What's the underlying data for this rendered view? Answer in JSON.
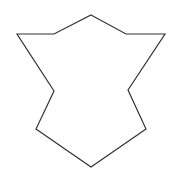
{
  "figure": {
    "width": 175,
    "height": 184,
    "background": "#ffffff",
    "shape": {
      "type": "polygon",
      "stroke": "#333333",
      "stroke_width": 1.2,
      "fill": "none",
      "points": [
        [
          91,
          15
        ],
        [
          126,
          34
        ],
        [
          165,
          34
        ],
        [
          128,
          90
        ],
        [
          146,
          129
        ],
        [
          91,
          167
        ],
        [
          36,
          129
        ],
        [
          54,
          91
        ],
        [
          17,
          34
        ],
        [
          54,
          34
        ]
      ]
    }
  }
}
